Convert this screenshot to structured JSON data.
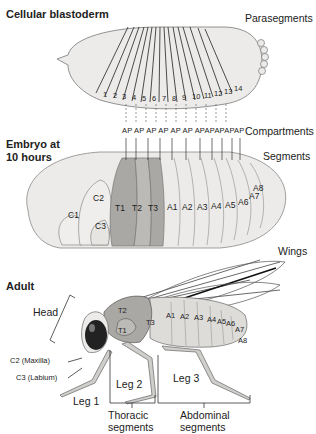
{
  "sections": {
    "blastoderm": {
      "title": "Cellular blastoderm",
      "right_label": "Parasegments"
    },
    "embryo": {
      "title_line1": "Embryo at",
      "title_line2": "10 hours",
      "compartments_label": "Compartments",
      "segments_label": "Segments"
    },
    "adult": {
      "title": "Adult",
      "wings_label": "Wings",
      "head_label": "Head"
    }
  },
  "parasegments": [
    "1",
    "2",
    "3",
    "4",
    "5",
    "6",
    "7",
    "8",
    "9",
    "10",
    "11",
    "12",
    "13",
    "14"
  ],
  "compartments": [
    "A",
    "P",
    "A",
    "P",
    "A",
    "P",
    "A",
    "P",
    "A",
    "P",
    "A",
    "P",
    "A",
    "P",
    "A",
    "P",
    "A",
    "P",
    "A",
    "P",
    "A",
    "P",
    "A",
    "P"
  ],
  "embryo_segments": [
    "C1",
    "C2",
    "C3",
    "T1",
    "T2",
    "T3",
    "A1",
    "A2",
    "A3",
    "A4",
    "A5",
    "A6",
    "A7",
    "A8"
  ],
  "adult_segments": [
    "T1",
    "T2",
    "T3",
    "A1",
    "A2",
    "A3",
    "A4",
    "A5",
    "A6",
    "A7",
    "A8"
  ],
  "adult_labels": {
    "c2": "C2 (Maxilla)",
    "c3": "C3 (Labium)",
    "leg1": "Leg 1",
    "leg2": "Leg 2",
    "leg3": "Leg 3",
    "thoracic_l1": "Thoracic",
    "thoracic_l2": "segments",
    "abdominal_l1": "Abdominal",
    "abdominal_l2": "segments"
  },
  "colors": {
    "embryo_fill": "#ecebe9",
    "thorax_dark": "#a8a7a3",
    "thorax_mid": "#bdbcb8",
    "line": "#2a2a2a"
  }
}
